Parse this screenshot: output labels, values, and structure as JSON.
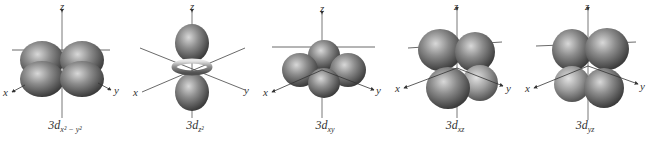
{
  "figure": {
    "orbitals": [
      {
        "id": "dx2-y2",
        "prefix": "3d",
        "subscript": "x² − y²"
      },
      {
        "id": "dz2",
        "prefix": "3d",
        "subscript": "z²"
      },
      {
        "id": "dxy",
        "prefix": "3d",
        "subscript": "xy"
      },
      {
        "id": "dxz",
        "prefix": "3d",
        "subscript": "xz"
      },
      {
        "id": "dyz",
        "prefix": "3d",
        "subscript": "yz"
      }
    ],
    "axes": {
      "x": "x",
      "y": "y",
      "z": "z"
    },
    "colors": {
      "lobe": "#7a7a7a",
      "lobe_highlight": "#d0d0d0",
      "lobe_shadow": "#3e3e3e",
      "axis": "#333333"
    }
  }
}
